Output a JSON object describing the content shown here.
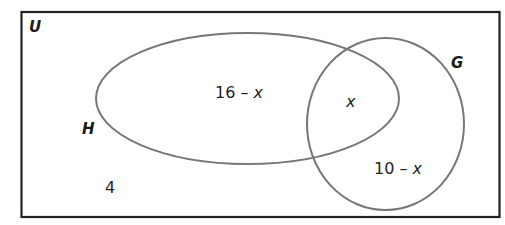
{
  "diagram": {
    "type": "venn",
    "universal_set": {
      "label": "U",
      "region_outside_sets": "4"
    },
    "sets": [
      {
        "name": "H",
        "label": "H",
        "only_region": {
          "prefix": "16 – ",
          "variable": "x"
        }
      },
      {
        "name": "G",
        "label": "G",
        "only_region": {
          "prefix": "10 – ",
          "variable": "x"
        }
      }
    ],
    "intersection": {
      "label": "x"
    },
    "colors": {
      "universal_border": "#222222",
      "set_border": "#777777",
      "background": "#ffffff"
    }
  }
}
